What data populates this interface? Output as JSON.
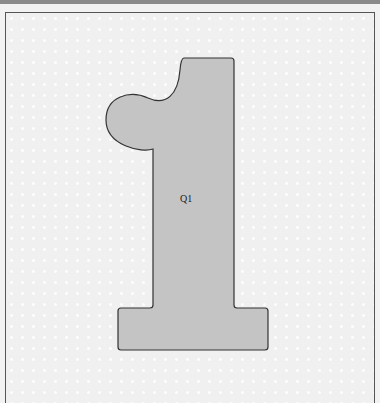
{
  "puzzle": {
    "piece_label": "Q1",
    "piece_fill": "#c4c4c4",
    "piece_stroke": "#333333",
    "board_background": "#f0f0f0"
  }
}
